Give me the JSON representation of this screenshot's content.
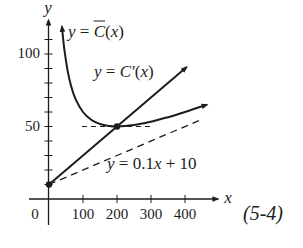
{
  "chart_data": {
    "type": "line",
    "title": "",
    "figure_label": "(5-4)",
    "xlabel": "x",
    "ylabel": "y",
    "xlim": [
      -59,
      503
    ],
    "ylim": [
      -18,
      125
    ],
    "grid": false,
    "legend": "none (curves labeled inline)",
    "x_ticks": [
      100,
      200,
      300,
      400
    ],
    "x_tick_labels": [
      "100",
      "200",
      "300",
      "400"
    ],
    "origin_label": "0",
    "y_ticks": [
      10,
      20,
      30,
      40,
      50,
      60,
      70,
      80,
      90,
      100,
      110
    ],
    "y_tick_labels": [
      {
        "value": 50,
        "label": "50"
      },
      {
        "value": 100,
        "label": "100"
      }
    ],
    "series": [
      {
        "name": "y = C̄(x)",
        "style": "solid",
        "arrows": "both",
        "points": [
          [
            38,
            119.1
          ],
          [
            45,
            103.4
          ],
          [
            55,
            88.2
          ],
          [
            65,
            78.0
          ],
          [
            80,
            68.0
          ],
          [
            100,
            60.0
          ],
          [
            125,
            54.5
          ],
          [
            150,
            51.7
          ],
          [
            175,
            50.4
          ],
          [
            200,
            50.0
          ],
          [
            250,
            51.0
          ],
          [
            300,
            53.3
          ],
          [
            350,
            56.4
          ],
          [
            400,
            60.0
          ],
          [
            465,
            65.1
          ]
        ]
      },
      {
        "name": "y = C'(x)",
        "style": "solid",
        "arrows": "end",
        "points": [
          [
            0,
            10
          ],
          [
            405,
            91
          ]
        ]
      },
      {
        "name": "y = 0.1x + 10",
        "style": "dashed",
        "arrows": "none",
        "points": [
          [
            0,
            10
          ],
          [
            445,
            54.5
          ]
        ]
      },
      {
        "name": "y = 50 (min reference)",
        "style": "dashed",
        "arrows": "none",
        "points": [
          [
            97,
            50
          ],
          [
            297,
            50
          ]
        ]
      }
    ],
    "marked_points": [
      [
        0,
        10
      ],
      [
        200,
        50
      ]
    ],
    "annotations": [
      "y = C̄(x)",
      "y = C'(x)",
      "y = 0.1x + 10",
      "(5-4)"
    ]
  },
  "labels": {
    "y_axis": "y",
    "x_axis": "x",
    "y100": "100",
    "y50": "50",
    "origin": "0",
    "x100": "100",
    "x200": "200",
    "x300": "300",
    "x400": "400",
    "avg_cost": {
      "lhs": "y",
      "eq": " = ",
      "fn": "C",
      "open": "(",
      "arg": "x",
      "close": ")"
    },
    "marginal": {
      "lhs": "y",
      "eq": " = ",
      "fn": "C′",
      "open": "(",
      "arg": "x",
      "close": ")"
    },
    "asymptote": {
      "lhs": "y",
      "rhs": " = 0.1",
      "var": "x",
      "tail": " + 10"
    },
    "figure": "(5-4)"
  }
}
